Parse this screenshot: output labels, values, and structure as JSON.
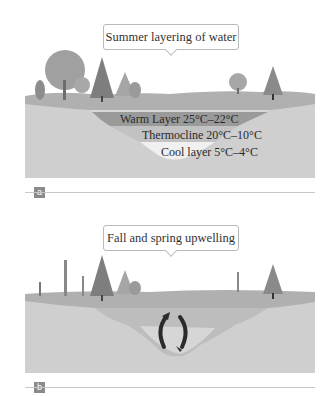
{
  "panels": [
    {
      "id": "a",
      "tag": "a",
      "title": "Summer layering of water",
      "layers": [
        {
          "name": "Warm Layer",
          "label": "Warm Layer 25°C–22°C",
          "range": "25°C–22°C"
        },
        {
          "name": "Thermocline",
          "label": "Thermocline 20°C–10°C",
          "range": "20°C–10°C"
        },
        {
          "name": "Cool layer",
          "label": "Cool layer 5°C–4°C",
          "range": "5°C–4°C"
        }
      ]
    },
    {
      "id": "b",
      "tag": "b",
      "title": "Fall and spring upwelling",
      "icons": [
        "circulation-arrows-icon"
      ]
    }
  ],
  "colors": {
    "ground": "#c9c9c9",
    "grass": "#a9a9a9",
    "warm": "#9e9e9e",
    "thermocline": "#c4c4c4",
    "cool": "#e8e8e8",
    "tree": "#8f8f8f",
    "arrow": "#2b2b2b"
  }
}
